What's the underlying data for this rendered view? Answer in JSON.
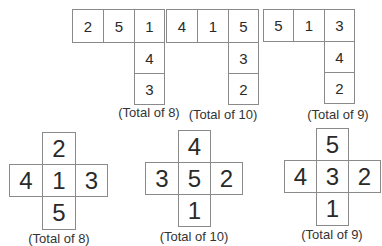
{
  "top_row": [
    {
      "label": "(Total of 8)",
      "row": [
        "2",
        "5",
        "1"
      ],
      "column": [
        "4",
        "3"
      ]
    },
    {
      "label": "(Total of 10)",
      "row": [
        "4",
        "1",
        "5"
      ],
      "column": [
        "3",
        "2"
      ]
    },
    {
      "label": "(Total of 9)",
      "row": [
        "5",
        "1",
        "3"
      ],
      "column": [
        "4",
        "2"
      ]
    }
  ],
  "bottom_row": [
    {
      "label": "(Total of 8)",
      "top": "2",
      "left": "4",
      "center": "1",
      "right": "3",
      "bottom": "5"
    },
    {
      "label": "(Total of 10)",
      "top": "4",
      "left": "3",
      "center": "5",
      "right": "2",
      "bottom": "1"
    },
    {
      "label": "(Total of 9)",
      "top": "5",
      "left": "4",
      "center": "3",
      "right": "2",
      "bottom": "1"
    }
  ]
}
